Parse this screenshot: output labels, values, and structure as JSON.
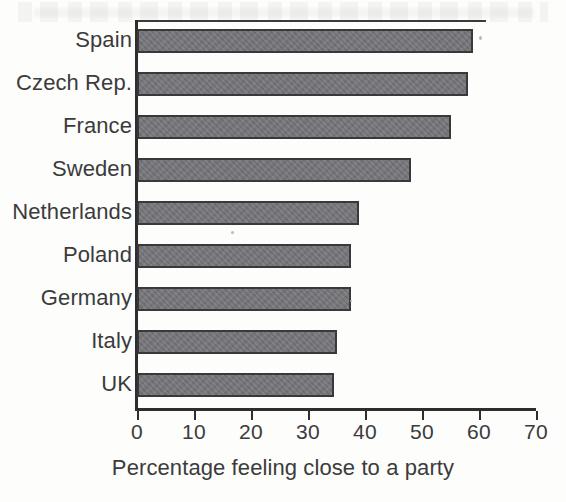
{
  "chart_data": {
    "type": "bar",
    "orientation": "horizontal",
    "title": "",
    "xlabel": "Percentage feeling close to a party",
    "ylabel": "",
    "categories": [
      "Spain",
      "Czech Rep.",
      "France",
      "Sweden",
      "Netherlands",
      "Poland",
      "Germany",
      "Italy",
      "UK"
    ],
    "values": [
      59,
      58,
      55,
      48,
      39,
      37.5,
      37.5,
      35,
      34.5
    ],
    "xlim": [
      0,
      70
    ],
    "xticks": [
      0,
      10,
      20,
      30,
      40,
      50,
      60,
      70
    ],
    "xtick_labels": [
      "0",
      "10",
      "20",
      "30",
      "40",
      "50",
      "60",
      "70"
    ],
    "grid": false,
    "legend": false,
    "bar_fill_color": "#75757a",
    "bar_edge_color": "#39393c",
    "axis_color": "#2e2e2e",
    "text_color": "#3b3b3b",
    "background_color": "#fdfdfc"
  },
  "axis": {
    "x_title": "Percentage feeling close to a party"
  }
}
